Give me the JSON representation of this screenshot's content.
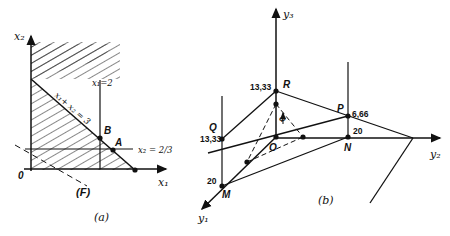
{
  "figure_a": {
    "caption": "(a)",
    "axis_x": "x₁",
    "axis_y": "x₂",
    "origin": "0",
    "line_x1": "x₁=2",
    "line_x2": "x₂ = 2/3",
    "line_sum": "x₁+ x₂ = 3",
    "point_a": "A",
    "point_b": "B",
    "line_f": "(F)"
  },
  "figure_b": {
    "caption": "(b)",
    "axis_y1": "y₁",
    "axis_y2": "y₂",
    "axis_y3": "y₃",
    "point_r": "R",
    "point_p": "P",
    "point_q": "Q",
    "point_o": "O",
    "point_n": "N",
    "point_m": "M",
    "phi": "Φ",
    "val_r": "13,33",
    "val_q": "13,33",
    "val_p": "6,66",
    "val_n": "20",
    "val_m": "20"
  }
}
